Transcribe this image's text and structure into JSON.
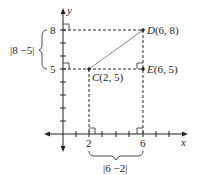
{
  "diagram": {
    "axes": {
      "x_label": "x",
      "y_label": "y"
    },
    "x_ticks": [
      "2",
      "6"
    ],
    "y_ticks": [
      "8",
      "5"
    ],
    "points": {
      "C": {
        "name": "C",
        "coords": "(2, 5)"
      },
      "D": {
        "name": "D",
        "coords": "(6, 8)"
      },
      "E": {
        "name": "E",
        "coords": "(6, 5)"
      }
    },
    "brace_vertical_label": "|8 −5|",
    "brace_horizontal_label": "|6 −2|",
    "colors": {
      "ink": "#222222",
      "segment": "#888888"
    }
  }
}
